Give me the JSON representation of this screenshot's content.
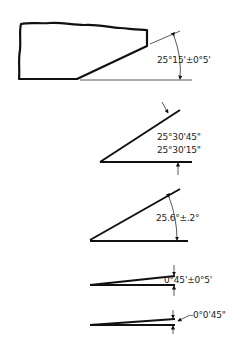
{
  "diagram": {
    "colors": {
      "line": "#111111",
      "background": "#ffffff"
    },
    "figures": [
      {
        "id": "part-chamfer",
        "label": "25°15'±0°5'"
      },
      {
        "id": "angle-limits",
        "label_upper": "25°30'45\"",
        "label_lower": "25°30'15\""
      },
      {
        "id": "decimal-angle",
        "label": "25.6°±.2°"
      },
      {
        "id": "small-angle",
        "label": "0°45'±0°5'"
      },
      {
        "id": "tiny-angle",
        "label": "-0°0'45\""
      }
    ]
  }
}
